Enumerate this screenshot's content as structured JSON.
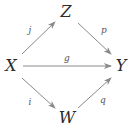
{
  "diagram": {
    "nodes": {
      "X": {
        "label": "X",
        "x": 11,
        "y": 66
      },
      "Z": {
        "label": "Z",
        "x": 66,
        "y": 12
      },
      "Y": {
        "label": "Y",
        "x": 121,
        "y": 66
      },
      "W": {
        "label": "W",
        "x": 67,
        "y": 118
      }
    },
    "edges": {
      "j": {
        "label": "j",
        "from": "X",
        "to": "Z",
        "label_x": 30,
        "label_y": 30
      },
      "p": {
        "label": "p",
        "from": "Z",
        "to": "Y",
        "label_x": 104,
        "label_y": 30
      },
      "g": {
        "label": "g",
        "from": "X",
        "to": "Y",
        "label_x": 67,
        "label_y": 58
      },
      "i": {
        "label": "i",
        "from": "X",
        "to": "W",
        "label_x": 30,
        "label_y": 102
      },
      "q": {
        "label": "q",
        "from": "W",
        "to": "Y",
        "label_x": 103,
        "label_y": 100
      }
    },
    "colors": {
      "arrow": "#8a8a8a",
      "node_text": "#2a2a2a",
      "label_text": "#555555"
    }
  }
}
